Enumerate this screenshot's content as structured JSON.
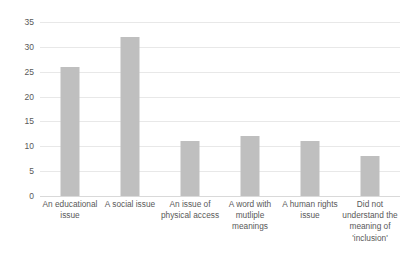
{
  "chart_data": {
    "type": "bar",
    "title": "",
    "subtitle": "",
    "xlabel": "",
    "ylabel": "",
    "ylim": [
      0,
      35
    ],
    "ytick_interval": 5,
    "yticks": [
      "0",
      "5",
      "10",
      "15",
      "20",
      "25",
      "30",
      "35"
    ],
    "grid": true,
    "legend": false,
    "legend_position": "none",
    "orientation": "vertical",
    "categories": [
      "An educational issue",
      "A social issue",
      "An issue of physical access",
      "A word with mutliple meanings",
      "A human rights issue",
      "Did not understand the meaning of 'inclusion'"
    ],
    "values": [
      26,
      32,
      11,
      12,
      11,
      8
    ],
    "colors": {
      "bar_fill": "#bfbfbf",
      "gridline": "#e8e8e8",
      "baseline": "#d9d9d9",
      "text": "#595959",
      "background": "#ffffff"
    }
  }
}
